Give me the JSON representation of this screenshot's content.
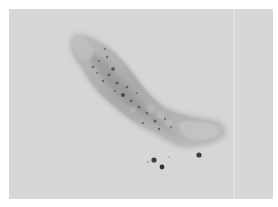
{
  "image": {
    "description": "Grayscale micrograph of an elongated, curved, worm-like organism with granular internal texture on a light gray background, with a few small dark particles below it",
    "colors": {
      "border": "#ffffff",
      "background": "#d6d6d6",
      "body_light": "#bdbdbd",
      "body_mid": "#a8a8a8",
      "body_dark": "#7a7a7a",
      "specks": "#3a3a3a"
    }
  }
}
